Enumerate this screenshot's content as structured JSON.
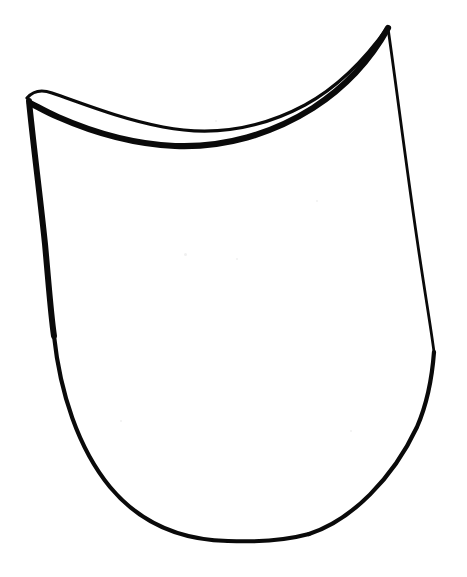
{
  "image": {
    "title": "Hand-drawn shield outline",
    "subject": "shield-shape-outline",
    "medium": "black ink line drawing on white paper",
    "width": 467,
    "height": 577,
    "background_color": "#ffffff",
    "ink_color": "#0a0a0a",
    "text_content": "",
    "has_text": false
  },
  "shape": {
    "name": "shield-outline",
    "description": "Closed hand-drawn contour resembling a shield or blade guard. The top edge is a deep concave sweep drawn as a double line with a thin white gap between an upper thin stroke and a lower thick stroke. The left side is a heavy tapering stroke angling down and slightly right. The right side is a thin nearly vertical stroke. The bottom is a broad rounded sweep with a nearly flat center.",
    "closed": true,
    "filled": false,
    "interior_color": "#ffffff",
    "key_points": {
      "top_left_corner": [
        27,
        98
      ],
      "top_right_peak": [
        388,
        27
      ],
      "top_curve_lowest": [
        190,
        146
      ],
      "left_widest": [
        54,
        336
      ],
      "bottom_lowest": [
        268,
        541
      ],
      "right_widest": [
        434,
        352
      ]
    },
    "strokes": [
      {
        "id": "outer-top-thin",
        "name": "top-edge-outer-thin-line",
        "weight": 3.2,
        "path": "M 27 98 C 33 91 41 89 52 93 C 84 104 121 119 163 127 C 214 137 262 128 305 105 C 338 87 366 58 388 27"
      },
      {
        "id": "inner-top-thick",
        "name": "top-edge-inner-thick-line",
        "weight": 6.2,
        "path": "M 30 103 C 38 107 46 112 58 117 C 92 132 131 144 175 146 C 224 148 272 134 313 108 C 347 86 372 57 388 28"
      },
      {
        "id": "left-edge",
        "name": "left-edge-thick-stroke",
        "weight": 6.0,
        "path": "M 29 101 C 33 142 40 196 45 244 C 49 288 51 316 54 336"
      },
      {
        "id": "left-bottom-sweep",
        "name": "bottom-left-rounded-sweep",
        "weight": 4.2,
        "path": "M 54 336 C 60 392 78 448 110 487 C 140 523 180 540 228 541"
      },
      {
        "id": "bottom-center",
        "name": "bottom-center-flat-segment",
        "weight": 4.0,
        "path": "M 228 541 C 252 542 283 541 309 534"
      },
      {
        "id": "right-bottom-sweep",
        "name": "bottom-right-rising-sweep",
        "weight": 4.2,
        "path": "M 309 534 C 352 520 393 478 417 427 C 427 404 432 379 434 352"
      },
      {
        "id": "right-edge",
        "name": "right-edge-thin-stroke",
        "weight": 2.8,
        "path": "M 388 28 C 396 84 406 164 417 239 C 425 294 431 328 434 352"
      }
    ]
  },
  "specks": [
    {
      "x": 184,
      "y": 253,
      "size": 3
    },
    {
      "x": 236,
      "y": 258,
      "size": 2
    },
    {
      "x": 316,
      "y": 200,
      "size": 2
    },
    {
      "x": 120,
      "y": 420,
      "size": 2
    },
    {
      "x": 350,
      "y": 430,
      "size": 2
    },
    {
      "x": 215,
      "y": 120,
      "size": 2
    }
  ]
}
